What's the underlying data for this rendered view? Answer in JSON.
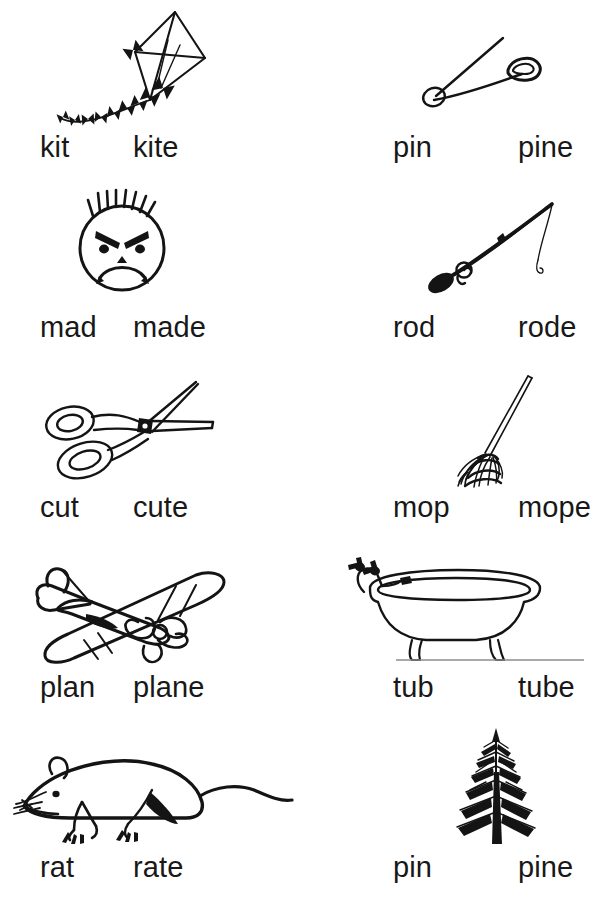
{
  "worksheet": {
    "title": "Short and Long Vowel Word Pairs",
    "background_color": "#ffffff",
    "ink_color": "#141414",
    "columns": 2,
    "rows": 5
  },
  "cells": [
    {
      "id": "kite",
      "row": 1,
      "column": "left",
      "picture": "kite-drawing",
      "short_word": "kit",
      "long_word": "kite"
    },
    {
      "id": "pin-safety",
      "row": 1,
      "column": "right",
      "picture": "safety-pin-drawing",
      "short_word": "pin",
      "long_word": "pine"
    },
    {
      "id": "mad",
      "row": 2,
      "column": "left",
      "picture": "angry-face-drawing",
      "short_word": "mad",
      "long_word": "made"
    },
    {
      "id": "rod",
      "row": 2,
      "column": "right",
      "picture": "fishing-rod-drawing",
      "short_word": "rod",
      "long_word": "rode"
    },
    {
      "id": "cut",
      "row": 3,
      "column": "left",
      "picture": "scissors-drawing",
      "short_word": "cut",
      "long_word": "cute"
    },
    {
      "id": "mop",
      "row": 3,
      "column": "right",
      "picture": "mop-drawing",
      "short_word": "mop",
      "long_word": "mope"
    },
    {
      "id": "plan",
      "row": 4,
      "column": "left",
      "picture": "airplane-drawing",
      "short_word": "plan",
      "long_word": "plane"
    },
    {
      "id": "tub",
      "row": 4,
      "column": "right",
      "picture": "bathtub-drawing",
      "short_word": "tub",
      "long_word": "tube"
    },
    {
      "id": "rat",
      "row": 5,
      "column": "left",
      "picture": "rat-drawing",
      "short_word": "rat",
      "long_word": "rate"
    },
    {
      "id": "pine-tree",
      "row": 5,
      "column": "right",
      "picture": "pine-tree-drawing",
      "short_word": "pin",
      "long_word": "pine"
    }
  ]
}
